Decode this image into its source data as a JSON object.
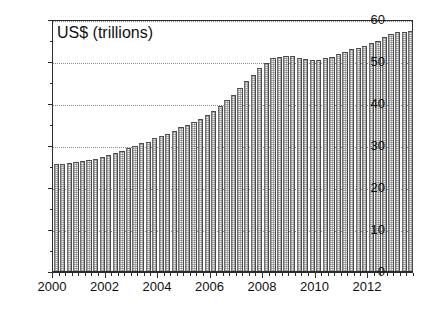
{
  "chart_data": {
    "type": "bar",
    "title": "US$ (trillions)",
    "xlabel": "",
    "ylabel": "US$ (trillions)",
    "ylim": [
      0,
      60
    ],
    "ytick_values": [
      0,
      10,
      20,
      30,
      40,
      50,
      60
    ],
    "ytick_labels": [
      "0",
      "10",
      "20",
      "30",
      "40",
      "50",
      "60"
    ],
    "y_minor_step": 5,
    "xlim": [
      2000.0,
      2013.75
    ],
    "xtick_labels": [
      "2000",
      "2002",
      "2004",
      "2006",
      "2008",
      "2010",
      "2012"
    ],
    "xtick_values": [
      2000,
      2002,
      2004,
      2006,
      2008,
      2010,
      2012
    ],
    "x_minor_step": 0.25,
    "grid": "horizontal-dotted",
    "legend": "none",
    "bar_fill": "#f2f2f2",
    "bar_edge": "#4a4a4a",
    "axis_color": "#2b2b2b",
    "grid_color": "#8e8e8e",
    "background": "#ffffff",
    "frequency": "quarterly",
    "x": [
      2000.0,
      2000.25,
      2000.5,
      2000.75,
      2001.0,
      2001.25,
      2001.5,
      2001.75,
      2002.0,
      2002.25,
      2002.5,
      2002.75,
      2003.0,
      2003.25,
      2003.5,
      2003.75,
      2004.0,
      2004.25,
      2004.5,
      2004.75,
      2005.0,
      2005.25,
      2005.5,
      2005.75,
      2006.0,
      2006.25,
      2006.5,
      2006.75,
      2007.0,
      2007.25,
      2007.5,
      2007.75,
      2008.0,
      2008.25,
      2008.5,
      2008.75,
      2009.0,
      2009.25,
      2009.5,
      2009.75,
      2010.0,
      2010.25,
      2010.5,
      2010.75,
      2011.0,
      2011.25,
      2011.5,
      2011.75,
      2012.0,
      2012.25,
      2012.5,
      2012.75,
      2013.0,
      2013.25,
      2013.5
    ],
    "categories": [
      "2000 Q1",
      "2000 Q2",
      "2000 Q3",
      "2000 Q4",
      "2001 Q1",
      "2001 Q2",
      "2001 Q3",
      "2001 Q4",
      "2002 Q1",
      "2002 Q2",
      "2002 Q3",
      "2002 Q4",
      "2003 Q1",
      "2003 Q2",
      "2003 Q3",
      "2003 Q4",
      "2004 Q1",
      "2004 Q2",
      "2004 Q3",
      "2004 Q4",
      "2005 Q1",
      "2005 Q2",
      "2005 Q3",
      "2005 Q4",
      "2006 Q1",
      "2006 Q2",
      "2006 Q3",
      "2006 Q4",
      "2007 Q1",
      "2007 Q2",
      "2007 Q3",
      "2007 Q4",
      "2008 Q1",
      "2008 Q2",
      "2008 Q3",
      "2008 Q4",
      "2009 Q1",
      "2009 Q2",
      "2009 Q3",
      "2009 Q4",
      "2010 Q1",
      "2010 Q2",
      "2010 Q3",
      "2010 Q4",
      "2011 Q1",
      "2011 Q2",
      "2011 Q3",
      "2011 Q4",
      "2012 Q1",
      "2012 Q2",
      "2012 Q3",
      "2012 Q4",
      "2013 Q1",
      "2013 Q2",
      "2013 Q3"
    ],
    "values": [
      25.4,
      25.5,
      25.6,
      25.9,
      26.2,
      26.4,
      26.6,
      27.2,
      27.6,
      28.0,
      28.6,
      29.4,
      29.8,
      30.4,
      30.8,
      31.6,
      32.2,
      32.6,
      33.4,
      34.4,
      34.8,
      35.4,
      36.2,
      37.2,
      38.2,
      39.4,
      40.6,
      42.0,
      43.6,
      45.2,
      46.6,
      48.4,
      49.6,
      50.6,
      51.0,
      51.2,
      51.1,
      50.6,
      50.4,
      50.2,
      50.3,
      50.6,
      51.0,
      51.6,
      52.2,
      52.8,
      53.2,
      53.6,
      54.2,
      54.8,
      55.6,
      56.4,
      56.8,
      57.0,
      57.1
    ]
  }
}
